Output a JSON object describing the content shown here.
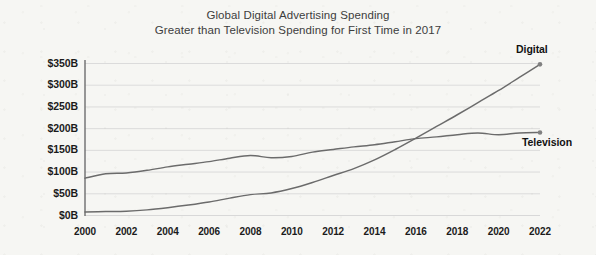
{
  "chart_data": {
    "type": "line",
    "title": "Global Digital Advertising Spending",
    "subtitle": "Greater than Television Spending for First Time in 2017",
    "xlabel": "",
    "ylabel": "",
    "ylim": [
      0,
      350
    ],
    "xlim": [
      2000,
      2022
    ],
    "y_unit": "B",
    "y_prefix": "$",
    "grid": true,
    "legend_position": "right-endpoint-labels",
    "y_ticks": [
      0,
      50,
      100,
      150,
      200,
      250,
      300,
      350
    ],
    "y_tick_labels": [
      "$0B",
      "$50B",
      "$100B",
      "$150B",
      "$200B",
      "$250B",
      "$300B",
      "$350B"
    ],
    "x_ticks": [
      2000,
      2002,
      2004,
      2006,
      2008,
      2010,
      2012,
      2014,
      2016,
      2018,
      2020,
      2022
    ],
    "x_tick_labels": [
      "2000",
      "2002",
      "2004",
      "2006",
      "2008",
      "2010",
      "2012",
      "2014",
      "2016",
      "2018",
      "2020",
      "2022"
    ],
    "x": [
      2000,
      2001,
      2002,
      2003,
      2004,
      2005,
      2006,
      2007,
      2008,
      2009,
      2010,
      2011,
      2012,
      2013,
      2014,
      2015,
      2016,
      2017,
      2018,
      2019,
      2020,
      2021,
      2022
    ],
    "series": [
      {
        "name": "Digital",
        "color": "#6b6b6b",
        "label_position": "above-end",
        "endpoint_marker": true,
        "values": [
          8,
          9,
          10,
          13,
          18,
          24,
          31,
          40,
          48,
          52,
          62,
          76,
          92,
          108,
          128,
          152,
          178,
          205,
          232,
          260,
          288,
          318,
          348
        ]
      },
      {
        "name": "Television",
        "color": "#6b6b6b",
        "label_position": "below-end",
        "endpoint_marker": true,
        "values": [
          86,
          96,
          98,
          104,
          112,
          118,
          124,
          132,
          138,
          133,
          136,
          146,
          152,
          158,
          163,
          170,
          177,
          181,
          186,
          190,
          186,
          190,
          191
        ]
      }
    ],
    "annotations": [
      {
        "text": "Digital",
        "at_x": 2022,
        "at_y": 348
      },
      {
        "text": "Television",
        "at_x": 2022,
        "at_y": 191
      }
    ]
  },
  "colors": {
    "background": "#f6f6f3",
    "axis": "#6e6e6e",
    "grid": "#d8d8d8",
    "text": "#1b1b1b",
    "title_text": "#3d3d3d",
    "line": "#6b6b6b"
  }
}
